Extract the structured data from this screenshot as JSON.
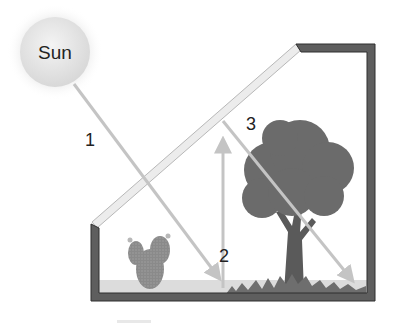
{
  "diagram": {
    "sun": {
      "label": "Sun"
    },
    "labels": {
      "ray1": "1",
      "ray2": "2",
      "ray3": "3"
    },
    "colors": {
      "frame": "#5a5a5a",
      "frame_dark": "#2e2e2e",
      "ray": "#c4c4c4",
      "glass": "#e6e6e6",
      "sun_fill": "#e2e2e2",
      "foliage": "#6a6a6a",
      "trunk": "#5c5c5c",
      "grass": "#6e6e6e",
      "ground": "#d6d6d6",
      "cactus": "#8f8f8f"
    },
    "elements": [
      "sun",
      "glass-roof",
      "frame",
      "cactus",
      "tree",
      "ground",
      "ray-1",
      "ray-2",
      "ray-3"
    ]
  }
}
